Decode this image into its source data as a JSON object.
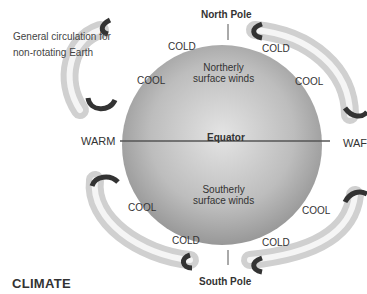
{
  "caption": {
    "line1": "General circulation for",
    "line2": "non-rotating Earth"
  },
  "poles": {
    "north": "North Pole",
    "south": "South Pole"
  },
  "equator": "Equator",
  "winds": {
    "north_l1": "Northerly",
    "north_l2": "surface winds",
    "south_l1": "Southerly",
    "south_l2": "surface winds"
  },
  "temps": {
    "cold_nw": "COLD",
    "cold_ne": "COLD",
    "cool_nw": "COOL",
    "cool_ne": "COOL",
    "warm_w": "WARM",
    "warm_e": "WAF",
    "cool_sw": "COOL",
    "cool_se": "COOL",
    "cold_sw": "COLD",
    "cold_se": "COLD"
  },
  "section_title": "CLIMATE",
  "colors": {
    "globe_dark": "#8a8a8a",
    "globe_light": "#d8d8d8",
    "loop": "#cfcfcf",
    "arrow": "#333333"
  }
}
